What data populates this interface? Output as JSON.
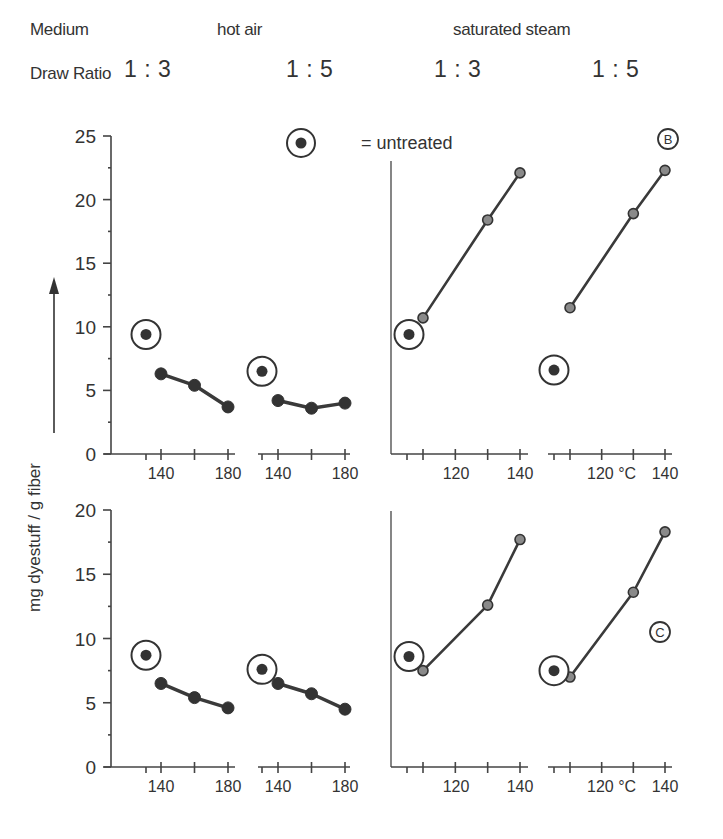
{
  "header": {
    "medium_label": "Medium",
    "draw_ratio_label": "Draw Ratio",
    "media": [
      "hot air",
      "saturated steam"
    ],
    "ratios": [
      "1 : 3",
      "1 : 5",
      "1 : 3",
      "1 : 5"
    ]
  },
  "legend": {
    "symbol": "untreated-circle-marker",
    "text": "= untreated"
  },
  "panel_tags": [
    "B",
    "C"
  ],
  "y_axis_label": "mg dyestuff / g fiber",
  "temperature_unit": "°C",
  "colors": {
    "line": "#3a3a3a",
    "hot_air_marker": "#333333",
    "steam_marker": "#8a8a8a",
    "axis": "#444444",
    "text": "#333333"
  },
  "chart_data": [
    {
      "type": "line",
      "title": "Panel B – dye uptake vs. setting temperature",
      "tag": "B",
      "ylabel": "mg dyestuff / g fiber",
      "xlabel": "°C",
      "ylim": [
        0,
        25
      ],
      "yticks": [
        0,
        5,
        10,
        15,
        20,
        25
      ],
      "grid": false,
      "legend": "= untreated (circled dot)",
      "subplots": [
        {
          "medium": "hot air",
          "draw_ratio": "1 : 3",
          "xticks": [
            140,
            160,
            180
          ],
          "xtick_labels": [
            "140",
            "180"
          ],
          "untreated": 9.4,
          "x": [
            140,
            160,
            180
          ],
          "y": [
            6.3,
            5.4,
            3.7
          ]
        },
        {
          "medium": "hot air",
          "draw_ratio": "1 : 5",
          "xticks": [
            140,
            160,
            180
          ],
          "xtick_labels": [
            "140",
            "180"
          ],
          "untreated": 6.5,
          "x": [
            140,
            160,
            180
          ],
          "y": [
            4.2,
            3.6,
            4.0
          ]
        },
        {
          "medium": "saturated steam",
          "draw_ratio": "1 : 3",
          "xticks": [
            110,
            120,
            130,
            140
          ],
          "xtick_labels": [
            "120",
            "140"
          ],
          "untreated": 9.4,
          "x": [
            110,
            130,
            140
          ],
          "y": [
            10.7,
            18.4,
            22.1
          ]
        },
        {
          "medium": "saturated steam",
          "draw_ratio": "1 : 5",
          "xticks": [
            110,
            120,
            130,
            140
          ],
          "xtick_labels": [
            "120 °C",
            "140"
          ],
          "untreated": 6.6,
          "x": [
            110,
            130,
            140
          ],
          "y": [
            11.5,
            18.9,
            22.3
          ]
        }
      ]
    },
    {
      "type": "line",
      "title": "Panel C – dye uptake vs. setting temperature",
      "tag": "C",
      "ylabel": "mg dyestuff / g fiber",
      "xlabel": "°C",
      "ylim": [
        0,
        20
      ],
      "yticks": [
        0,
        5,
        10,
        15,
        20
      ],
      "grid": false,
      "subplots": [
        {
          "medium": "hot air",
          "draw_ratio": "1 : 3",
          "xticks": [
            140,
            160,
            180
          ],
          "xtick_labels": [
            "140",
            "180"
          ],
          "untreated": 8.7,
          "x": [
            140,
            160,
            180
          ],
          "y": [
            6.5,
            5.4,
            4.6
          ]
        },
        {
          "medium": "hot air",
          "draw_ratio": "1 : 5",
          "xticks": [
            140,
            160,
            180
          ],
          "xtick_labels": [
            "140",
            "180"
          ],
          "untreated": 7.6,
          "x": [
            140,
            160,
            180
          ],
          "y": [
            6.5,
            5.7,
            4.5
          ]
        },
        {
          "medium": "saturated steam",
          "draw_ratio": "1 : 3",
          "xticks": [
            110,
            120,
            130,
            140
          ],
          "xtick_labels": [
            "120",
            "140"
          ],
          "untreated": 8.6,
          "x": [
            110,
            130,
            140
          ],
          "y": [
            7.5,
            12.6,
            17.7
          ]
        },
        {
          "medium": "saturated steam",
          "draw_ratio": "1 : 5",
          "xticks": [
            110,
            120,
            130,
            140
          ],
          "xtick_labels": [
            "120 °C",
            "140"
          ],
          "untreated": 7.5,
          "x": [
            110,
            130,
            140
          ],
          "y": [
            7.0,
            13.6,
            18.3
          ]
        }
      ]
    }
  ]
}
